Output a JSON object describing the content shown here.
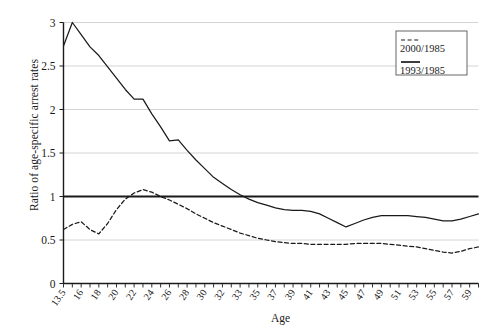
{
  "chart_data": {
    "type": "line",
    "title": "",
    "xlabel": "Age",
    "ylabel": "Ratio of age-specific arrest rates",
    "ylim": [
      0,
      3
    ],
    "yticks": [
      0,
      0.5,
      1,
      1.5,
      2,
      2.5,
      3
    ],
    "ytick_labels": [
      "0",
      "0.5",
      "1",
      "1.5",
      "2",
      "2.5",
      "3"
    ],
    "grid": true,
    "grid_axis": "y",
    "legend_position": "top-right",
    "reference_line": 1,
    "x": [
      13.5,
      15,
      16,
      17,
      18,
      19,
      20,
      21,
      22,
      23,
      24,
      25,
      26,
      27,
      28,
      29,
      30,
      31,
      32,
      33,
      34,
      35,
      36,
      37,
      38,
      39,
      40,
      41,
      42,
      43,
      44,
      45,
      46,
      47,
      48,
      49,
      50,
      51,
      52,
      53,
      54,
      55,
      56,
      57,
      58,
      59,
      60,
      61
    ],
    "xtick_labels": [
      "13.5",
      "16",
      "18",
      "20",
      "22",
      "24",
      "26",
      "28",
      "30",
      "32",
      "33",
      "35",
      "37",
      "39",
      "41",
      "43",
      "45",
      "47",
      "49",
      "51",
      "53",
      "55",
      "57",
      "59",
      "61"
    ],
    "series": [
      {
        "name": "1993/1985",
        "style": "solid",
        "color": "#1a1a1a",
        "values": [
          2.73,
          3.0,
          2.86,
          2.72,
          2.62,
          2.49,
          2.36,
          2.23,
          2.12,
          2.12,
          1.95,
          1.8,
          1.64,
          1.65,
          1.53,
          1.42,
          1.32,
          1.22,
          1.15,
          1.08,
          1.02,
          0.97,
          0.93,
          0.9,
          0.87,
          0.85,
          0.84,
          0.84,
          0.83,
          0.8,
          0.75,
          0.7,
          0.65,
          0.69,
          0.73,
          0.76,
          0.78,
          0.78,
          0.78,
          0.78,
          0.77,
          0.76,
          0.74,
          0.72,
          0.72,
          0.74,
          0.77,
          0.8
        ]
      },
      {
        "name": "2000/1985",
        "style": "dashed",
        "color": "#1a1a1a",
        "values": [
          0.62,
          0.68,
          0.71,
          0.62,
          0.57,
          0.69,
          0.85,
          0.97,
          1.04,
          1.08,
          1.05,
          1.0,
          0.96,
          0.91,
          0.86,
          0.8,
          0.75,
          0.7,
          0.66,
          0.62,
          0.58,
          0.55,
          0.52,
          0.5,
          0.48,
          0.47,
          0.46,
          0.46,
          0.45,
          0.45,
          0.45,
          0.45,
          0.45,
          0.46,
          0.46,
          0.46,
          0.46,
          0.45,
          0.44,
          0.43,
          0.42,
          0.4,
          0.38,
          0.36,
          0.35,
          0.37,
          0.4,
          0.42
        ]
      }
    ]
  },
  "legend": {
    "entries": [
      {
        "label": "2000/1985",
        "style": "dashed"
      },
      {
        "label": "1993/1985",
        "style": "solid"
      }
    ]
  },
  "axes": {
    "y_title": "Ratio of age-specific arrest rates",
    "x_title": "Age"
  }
}
